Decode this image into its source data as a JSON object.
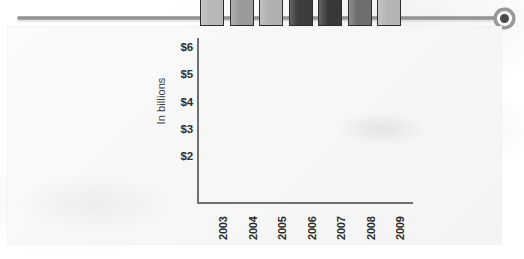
{
  "page": {
    "rule": {
      "knob_icon": "circle-knob-icon"
    }
  },
  "chart_data": {
    "type": "bar",
    "title": "",
    "xlabel": "",
    "ylabel": "In billions",
    "categories": [
      "2003",
      "2004",
      "2005",
      "2006",
      "2007",
      "2008",
      "2009"
    ],
    "values": [
      2.4,
      2.7,
      3.3,
      4.05,
      4.7,
      5.6,
      6.15
    ],
    "ytick_labels": [
      "$6",
      "$5",
      "$4",
      "$3",
      "$2"
    ],
    "ytick_values": [
      6,
      5,
      4,
      3,
      2
    ],
    "ylim": [
      0.38,
      6.35
    ],
    "grid": false,
    "legend": "none",
    "bar_colors": [
      "#b8b8b8",
      "#9a9a9a",
      "#b0b0b0",
      "#3c3c3c",
      "#383838",
      "#6e6e6e",
      "#b4b4b4"
    ]
  }
}
